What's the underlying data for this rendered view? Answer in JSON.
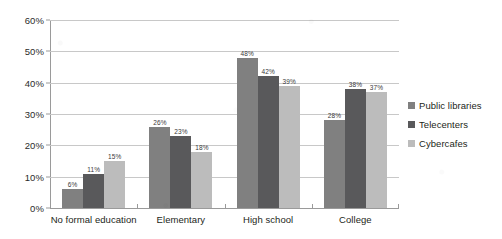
{
  "chart_data": {
    "type": "bar",
    "title": "",
    "subtitle": "",
    "xlabel": "",
    "ylabel": "",
    "ylim": [
      0,
      60
    ],
    "ytick_labels": [
      "0%",
      "10%",
      "20%",
      "30%",
      "40%",
      "50%",
      "60%"
    ],
    "ytick_values": [
      0,
      10,
      20,
      30,
      40,
      50,
      60
    ],
    "grid": "horizontal",
    "legend_position": "right",
    "categories": [
      "No formal education",
      "Elementary",
      "High school",
      "College"
    ],
    "series": [
      {
        "name": "Public libraries",
        "color": "#808080",
        "values": [
          6,
          26,
          48,
          28
        ],
        "labels": [
          "6%",
          "26%",
          "48%",
          "28%"
        ]
      },
      {
        "name": "Telecenters",
        "color": "#59595b",
        "values": [
          11,
          23,
          42,
          38
        ],
        "labels": [
          "11%",
          "23%",
          "42%",
          "38%"
        ]
      },
      {
        "name": "Cybercafes",
        "color": "#bcbcbc",
        "values": [
          15,
          18,
          39,
          37
        ],
        "labels": [
          "15%",
          "18%",
          "39%",
          "37%"
        ]
      }
    ]
  },
  "colors": {
    "background": "#ffffff",
    "axis": "#9a9a9a",
    "gridline": "#c8c8c8",
    "text": "#231f20",
    "series_public_libraries": "#808080",
    "series_telecenters": "#59595b",
    "series_cybercafes": "#bcbcbc"
  }
}
